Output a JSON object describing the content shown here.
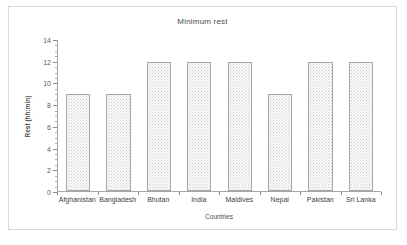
{
  "chart_data": {
    "type": "bar",
    "title": "Minimum rest",
    "xlabel": "Countries",
    "ylabel": "Rest (hh:min)",
    "categories": [
      "Afghanistan",
      "Bangladesh",
      "Bhutan",
      "India",
      "Maldives",
      "Nepal",
      "Pakistan",
      "Sri Lanka"
    ],
    "values": [
      9,
      9,
      12,
      12,
      12,
      9,
      12,
      12
    ],
    "ylim": [
      0,
      14
    ],
    "ytick_labels": [
      "0",
      "2",
      "4",
      "6",
      "8",
      "10",
      "12",
      "14"
    ],
    "ytick_values": [
      0,
      2,
      4,
      6,
      8,
      10,
      12,
      14
    ],
    "ytick_minor_step": 0.5,
    "grid": false,
    "legend": false,
    "series": [
      {
        "name": "Minimum rest",
        "values": [
          9,
          9,
          12,
          12,
          12,
          9,
          12,
          12
        ]
      }
    ],
    "colors": {
      "bar_fill": "#fbfbfb",
      "bar_pattern": "#c9c9c9",
      "bar_border": "#a6a6a6",
      "axis": "#a6a6a6",
      "text": "#4d4d4d",
      "frame": "#d9d9d9",
      "background": "#ffffff"
    }
  }
}
